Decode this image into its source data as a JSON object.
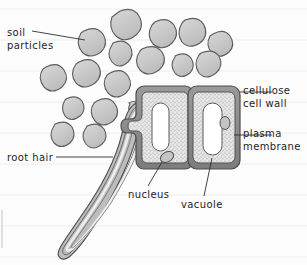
{
  "diagram": {
    "background": {
      "paper_color": "#fdfdfd",
      "ruled_line_color": "#eceaea",
      "ruled_line_spacing_px": 31,
      "ruled_lines_y": [
        9,
        40,
        71,
        102,
        133,
        164,
        195,
        226,
        257
      ],
      "left_margin_artifact": true
    },
    "palette": {
      "ink": "#1d1d1d",
      "outline": "#4a4a4a",
      "soil_fill_light": "#d2d2d2",
      "soil_fill_dark": "#b9b9b9",
      "cell_wall": "#8c8c8c",
      "cell_wall_dark": "#6f6f6f",
      "membrane": "#5a5a5a",
      "cytoplasm": "#e3e3e3",
      "vacuole": "#ffffff",
      "nucleus_fill": "#c9c9c9",
      "leader_line": "#3a3a3a"
    },
    "labels": [
      {
        "id": "soil-particles",
        "text_line1": "soil",
        "text_line2": "particles",
        "leader": "line from text to a soil particle",
        "position": "top-left"
      },
      {
        "id": "root-hair",
        "text_line1": "root hair",
        "text_line2": "",
        "leader": "horizontal line to root hair tube",
        "position": "mid-left"
      },
      {
        "id": "cellulose-cell-wall",
        "text_line1": "cellulose",
        "text_line2": "cell wall",
        "leader": "horizontal line to outer wall of right cell",
        "position": "top-right"
      },
      {
        "id": "plasma-membrane",
        "text_line1": "plasma",
        "text_line2": "membrane",
        "leader": "horizontal line to membrane layer of right cell",
        "position": "mid-right"
      },
      {
        "id": "nucleus",
        "text_line1": "nucleus",
        "text_line2": "",
        "leader": "diagonal line up to oval nucleus in left cell",
        "position": "bottom-centre"
      },
      {
        "id": "vacuole",
        "text_line1": "vacuole",
        "text_line2": "",
        "leader": "vertical line up to vacuole of right cell",
        "position": "bottom-centre-right"
      }
    ],
    "soil_particles": {
      "count": 17,
      "description": "irregular rounded blobs, grey fill with darker outline, clustered above and to the left of the cells"
    },
    "cells": {
      "count": 2,
      "shape": "rounded rectangle",
      "parts": [
        "cellulose cell wall",
        "plasma membrane",
        "cytoplasm",
        "vacuole",
        "nucleus"
      ],
      "left_cell": {
        "has_nucleus": true,
        "has_vacuole": true,
        "connects_to": "root hair"
      },
      "right_cell": {
        "has_nucleus": true,
        "has_vacuole": true
      }
    },
    "root_hair": {
      "description": "long tapering tube extending down and to the left from the left cell, with rounded tip",
      "layers": 3
    }
  }
}
